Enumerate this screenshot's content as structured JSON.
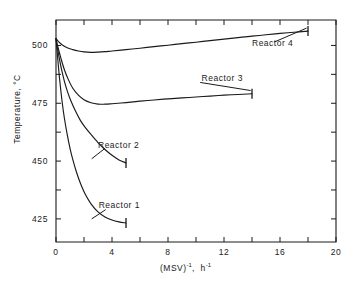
{
  "chart_data": {
    "type": "line",
    "title": "",
    "xlabel": "(MSV)^-1, h^-1",
    "xlabel_parts": {
      "base1": "(MSV)",
      "exp1": "-1",
      "sep": ",",
      "base2": "h",
      "exp2": "-1"
    },
    "ylabel": "Temperature, °C",
    "xlim": [
      0,
      20
    ],
    "ylim": [
      415,
      511
    ],
    "xticks": [
      0,
      2,
      4,
      6,
      8,
      10,
      12,
      14,
      16,
      18,
      20
    ],
    "xtick_labels": [
      "0",
      "",
      "4",
      "",
      "8",
      "",
      "12",
      "",
      "16",
      "",
      "20"
    ],
    "yticks": [
      425,
      437.5,
      450,
      462.5,
      475,
      487.5,
      500
    ],
    "ytick_labels": [
      "425",
      "",
      "450",
      "",
      "475",
      "",
      "500"
    ],
    "grid": false,
    "legend_position": "inline-annotations",
    "series": [
      {
        "name": "Reactor 1",
        "label": "Reactor 1",
        "label_x": 3.05,
        "label_y": 430.5,
        "end_marker": true,
        "points": [
          [
            0.0,
            503.0
          ],
          [
            0.1,
            496.0
          ],
          [
            0.2,
            489.0
          ],
          [
            0.3,
            483.0
          ],
          [
            0.45,
            475.0
          ],
          [
            0.6,
            468.5
          ],
          [
            0.8,
            461.5
          ],
          [
            1.0,
            455.5
          ],
          [
            1.25,
            449.5
          ],
          [
            1.5,
            444.5
          ],
          [
            1.8,
            439.5
          ],
          [
            2.1,
            435.5
          ],
          [
            2.5,
            431.5
          ],
          [
            3.0,
            428.0
          ],
          [
            3.5,
            425.8
          ],
          [
            4.0,
            424.5
          ],
          [
            4.5,
            423.7
          ],
          [
            5.0,
            423.2
          ]
        ]
      },
      {
        "name": "Reactor 2",
        "label": "Reactor 2",
        "label_x": 3.0,
        "label_y": 456.5,
        "end_marker": true,
        "points": [
          [
            0.0,
            503.0
          ],
          [
            0.1,
            499.0
          ],
          [
            0.25,
            494.0
          ],
          [
            0.4,
            489.5
          ],
          [
            0.6,
            484.5
          ],
          [
            0.85,
            479.5
          ],
          [
            1.1,
            475.5
          ],
          [
            1.4,
            471.5
          ],
          [
            1.75,
            467.5
          ],
          [
            2.1,
            464.5
          ],
          [
            2.5,
            461.5
          ],
          [
            3.0,
            458.0
          ],
          [
            3.5,
            455.0
          ],
          [
            4.0,
            452.5
          ],
          [
            4.5,
            450.5
          ],
          [
            5.0,
            449.2
          ]
        ]
      },
      {
        "name": "Reactor 3",
        "label": "Reactor 3",
        "label_x": 10.4,
        "label_y": 485.5,
        "end_marker": true,
        "points": [
          [
            0.0,
            503.0
          ],
          [
            0.15,
            499.0
          ],
          [
            0.35,
            494.5
          ],
          [
            0.6,
            489.5
          ],
          [
            0.9,
            485.0
          ],
          [
            1.2,
            481.5
          ],
          [
            1.6,
            478.5
          ],
          [
            2.0,
            476.5
          ],
          [
            2.5,
            475.2
          ],
          [
            3.0,
            474.6
          ],
          [
            3.5,
            474.6
          ],
          [
            4.0,
            474.8
          ],
          [
            5.0,
            475.3
          ],
          [
            6.0,
            475.9
          ],
          [
            7.0,
            476.4
          ],
          [
            8.0,
            476.9
          ],
          [
            9.0,
            477.3
          ],
          [
            10.0,
            477.7
          ],
          [
            11.0,
            478.1
          ],
          [
            12.0,
            478.5
          ],
          [
            13.0,
            478.8
          ],
          [
            14.0,
            479.1
          ]
        ]
      },
      {
        "name": "Reactor 4",
        "label": "Reactor 4",
        "label_x": 14.0,
        "label_y": 500.5,
        "end_marker": true,
        "points": [
          [
            0.0,
            503.0
          ],
          [
            0.2,
            501.5
          ],
          [
            0.45,
            500.2
          ],
          [
            0.8,
            499.0
          ],
          [
            1.2,
            498.2
          ],
          [
            1.6,
            497.6
          ],
          [
            2.0,
            497.2
          ],
          [
            2.5,
            497.0
          ],
          [
            3.0,
            497.1
          ],
          [
            3.5,
            497.3
          ],
          [
            4.0,
            497.6
          ],
          [
            5.0,
            498.2
          ],
          [
            6.0,
            498.8
          ],
          [
            7.0,
            499.5
          ],
          [
            8.0,
            500.1
          ],
          [
            9.0,
            500.8
          ],
          [
            10.0,
            501.4
          ],
          [
            11.0,
            502.1
          ],
          [
            12.0,
            502.7
          ],
          [
            13.0,
            503.4
          ],
          [
            14.0,
            504.0
          ],
          [
            15.0,
            504.6
          ],
          [
            16.0,
            505.2
          ],
          [
            17.0,
            505.7
          ],
          [
            18.0,
            506.2
          ]
        ]
      }
    ],
    "leaders": [
      {
        "name": "Reactor 1",
        "from_x": 3.55,
        "from_y": 429.0,
        "to_x": 2.55,
        "to_y": 425.0
      },
      {
        "name": "Reactor 2",
        "from_x": 3.5,
        "from_y": 455.5,
        "to_x": 2.55,
        "to_y": 451.0
      },
      {
        "name": "Reactor 3",
        "from_x": 10.3,
        "from_y": 484.0,
        "to_x": 13.9,
        "to_y": 480.5
      },
      {
        "name": "Reactor 4",
        "from_x": 15.6,
        "from_y": 501.5,
        "to_x": 17.9,
        "to_y": 507.5
      }
    ]
  },
  "axes": {
    "x_label_text": "(MSV)",
    "y_label_text": "Temperature, °C"
  }
}
